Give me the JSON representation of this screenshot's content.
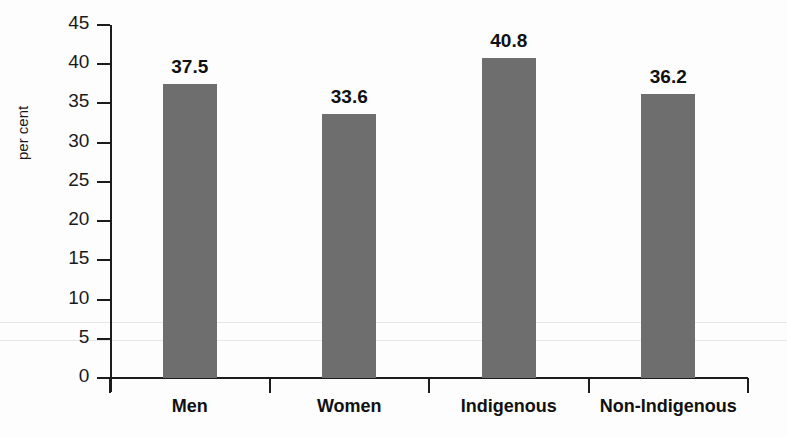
{
  "chart_data": {
    "type": "bar",
    "title": "",
    "subtitle": "",
    "xlabel": "",
    "ylabel": "per cent",
    "categories": [
      "Men",
      "Women",
      "Indigenous",
      "Non-Indigenous"
    ],
    "values": [
      37.5,
      33.6,
      40.8,
      36.2
    ],
    "value_labels": [
      "37.5",
      "33.6",
      "40.8",
      "36.2"
    ],
    "ylim": [
      0,
      45
    ],
    "ytick_step": 5,
    "ytick_labels": [
      "0",
      "5",
      "10",
      "15",
      "20",
      "25",
      "30",
      "35",
      "40",
      "45"
    ],
    "ytick_values": [
      0,
      5,
      10,
      15,
      20,
      25,
      30,
      35,
      40,
      45
    ],
    "grid": false,
    "legend": null,
    "legend_position": "none",
    "bar_color": "#6e6e6e",
    "axis_color": "#1c1c1c",
    "text_color": "#111111",
    "background_color": "#fdfdfd",
    "series": [
      {
        "name": "per cent",
        "values": [
          37.5,
          33.6,
          40.8,
          36.2
        ]
      }
    ]
  }
}
